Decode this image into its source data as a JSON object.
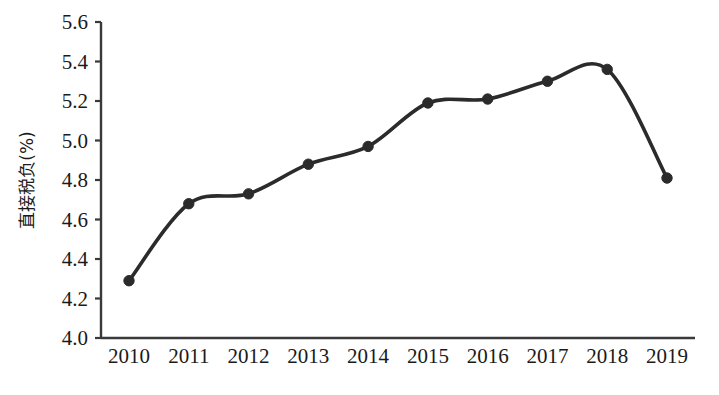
{
  "chart_data": {
    "type": "line",
    "title": "",
    "xlabel": "",
    "ylabel": "直接税负(%)",
    "categories": [
      "2010",
      "2011",
      "2012",
      "2013",
      "2014",
      "2015",
      "2016",
      "2017",
      "2018",
      "2019"
    ],
    "values": [
      4.29,
      4.68,
      4.73,
      4.88,
      4.97,
      5.19,
      5.21,
      5.3,
      5.36,
      4.81
    ],
    "series": [
      {
        "name": "直接税负",
        "values": [
          4.29,
          4.68,
          4.73,
          4.88,
          4.97,
          5.19,
          5.21,
          5.3,
          5.36,
          4.81
        ]
      }
    ],
    "ylim": [
      4.0,
      5.6
    ],
    "ytick_labels": [
      "4.0",
      "4.2",
      "4.4",
      "4.6",
      "4.8",
      "5.0",
      "5.2",
      "5.4",
      "5.6"
    ],
    "ytick_values": [
      4.0,
      4.2,
      4.4,
      4.6,
      4.8,
      5.0,
      5.2,
      5.4,
      5.6
    ],
    "grid": false,
    "legend": false,
    "legend_position": "none",
    "marker": "circle",
    "line_color": "#2b2b2b",
    "marker_color": "#2b2b2b",
    "axis_color": "#3a3a3a",
    "background_color": "#ffffff",
    "smooth": true,
    "annotations": []
  },
  "figure": {
    "caption_partial": ""
  }
}
